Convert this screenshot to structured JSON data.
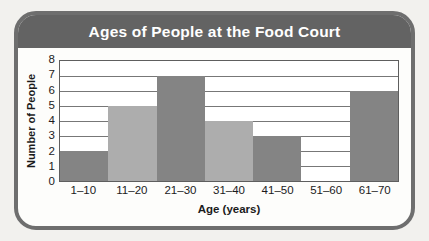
{
  "chart_data": {
    "type": "bar",
    "title": "Ages of People at the Food Court",
    "xlabel": "Age (years)",
    "ylabel": "Number of People",
    "categories": [
      "1–10",
      "11–20",
      "21–30",
      "31–40",
      "41–50",
      "51–60",
      "61–70"
    ],
    "values": [
      2,
      5,
      7,
      4,
      3,
      0,
      6
    ],
    "bar_colors": [
      "#848484",
      "#adadad",
      "#848484",
      "#adadad",
      "#848484",
      "#adadad",
      "#848484"
    ],
    "ylim": [
      0,
      8
    ],
    "ytick_labels": [
      "8",
      "7",
      "6",
      "5",
      "4",
      "3",
      "2",
      "1",
      "0"
    ],
    "ytick_values": [
      8,
      7,
      6,
      5,
      4,
      3,
      2,
      1,
      0
    ],
    "grid": true,
    "grid_axis": "y",
    "legend": null,
    "xlim_categorical": true,
    "bar_gap": 0
  },
  "style": {
    "header_background": "#636363",
    "title_color": "#ffffff",
    "frame_border_color": "#6e6e6e",
    "page_background": "#f2f1ee",
    "plot_background": "#ffffff",
    "gridline_color": "#777777",
    "axis_text_color": "#1b1b1b"
  }
}
